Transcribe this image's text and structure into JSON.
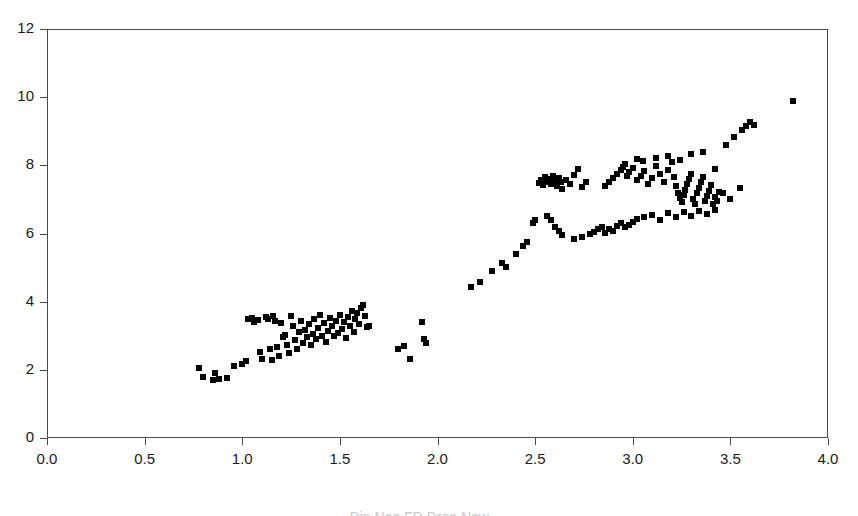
{
  "chart_data": {
    "type": "scatter",
    "title": "",
    "subtitle": "",
    "xlabel": "",
    "ylabel": "",
    "xlim": [
      0.0,
      4.0
    ],
    "ylim": [
      0,
      12
    ],
    "grid": false,
    "legend": null,
    "marker": {
      "shape": "square",
      "color": "#000000",
      "size_px": 6
    },
    "frame": {
      "border_color": "#4a4a4a",
      "background": "#ffffff"
    },
    "xticks": [
      0.0,
      0.5,
      1.0,
      1.5,
      2.0,
      2.5,
      3.0,
      3.5,
      4.0
    ],
    "xtick_labels": [
      "0.0",
      "0.5",
      "1.0",
      "1.5",
      "2.0",
      "2.5",
      "3.0",
      "3.5",
      "4.0"
    ],
    "yticks": [
      0,
      2,
      4,
      6,
      8,
      10,
      12
    ],
    "ytick_labels": [
      "0",
      "2",
      "4",
      "6",
      "8",
      "10",
      "12"
    ],
    "series": [
      {
        "name": "observations",
        "points": [
          [
            0.78,
            2.05
          ],
          [
            0.8,
            1.78
          ],
          [
            0.85,
            1.7
          ],
          [
            0.86,
            1.9
          ],
          [
            0.88,
            1.72
          ],
          [
            0.92,
            1.76
          ],
          [
            0.96,
            2.1
          ],
          [
            1.0,
            2.18
          ],
          [
            1.02,
            2.25
          ],
          [
            1.03,
            3.48
          ],
          [
            1.05,
            3.52
          ],
          [
            1.06,
            3.4
          ],
          [
            1.08,
            3.46
          ],
          [
            1.09,
            2.52
          ],
          [
            1.1,
            2.32
          ],
          [
            1.12,
            3.55
          ],
          [
            1.13,
            3.5
          ],
          [
            1.14,
            2.6
          ],
          [
            1.15,
            2.28
          ],
          [
            1.16,
            3.58
          ],
          [
            1.17,
            3.44
          ],
          [
            1.18,
            2.68
          ],
          [
            1.19,
            2.4
          ],
          [
            1.2,
            3.38
          ],
          [
            1.21,
            2.95
          ],
          [
            1.22,
            3.02
          ],
          [
            1.23,
            2.72
          ],
          [
            1.24,
            2.5
          ],
          [
            1.25,
            3.58
          ],
          [
            1.26,
            3.3
          ],
          [
            1.27,
            2.88
          ],
          [
            1.28,
            2.62
          ],
          [
            1.29,
            3.1
          ],
          [
            1.3,
            3.42
          ],
          [
            1.31,
            2.8
          ],
          [
            1.32,
            3.18
          ],
          [
            1.33,
            2.96
          ],
          [
            1.34,
            3.34
          ],
          [
            1.35,
            2.74
          ],
          [
            1.36,
            3.05
          ],
          [
            1.37,
            3.48
          ],
          [
            1.38,
            2.9
          ],
          [
            1.39,
            3.22
          ],
          [
            1.4,
            3.6
          ],
          [
            1.41,
            3.0
          ],
          [
            1.42,
            3.36
          ],
          [
            1.43,
            2.82
          ],
          [
            1.44,
            3.14
          ],
          [
            1.45,
            3.52
          ],
          [
            1.46,
            3.28
          ],
          [
            1.47,
            2.98
          ],
          [
            1.48,
            3.44
          ],
          [
            1.49,
            3.08
          ],
          [
            1.5,
            3.62
          ],
          [
            1.51,
            3.2
          ],
          [
            1.52,
            3.4
          ],
          [
            1.53,
            2.92
          ],
          [
            1.54,
            3.56
          ],
          [
            1.55,
            3.3
          ],
          [
            1.56,
            3.74
          ],
          [
            1.57,
            3.12
          ],
          [
            1.58,
            3.5
          ],
          [
            1.59,
            3.66
          ],
          [
            1.6,
            3.34
          ],
          [
            1.61,
            3.82
          ],
          [
            1.62,
            3.9
          ],
          [
            1.63,
            3.58
          ],
          [
            1.64,
            3.26
          ],
          [
            1.65,
            3.3
          ],
          [
            1.8,
            2.62
          ],
          [
            1.83,
            2.7
          ],
          [
            1.86,
            2.32
          ],
          [
            1.92,
            3.4
          ],
          [
            1.93,
            2.9
          ],
          [
            1.94,
            2.78
          ],
          [
            2.17,
            4.42
          ],
          [
            2.22,
            4.58
          ],
          [
            2.28,
            4.9
          ],
          [
            2.33,
            5.12
          ],
          [
            2.35,
            5.02
          ],
          [
            2.4,
            5.4
          ],
          [
            2.44,
            5.62
          ],
          [
            2.46,
            5.74
          ],
          [
            2.49,
            6.32
          ],
          [
            2.5,
            6.4
          ],
          [
            2.52,
            7.48
          ],
          [
            2.53,
            7.58
          ],
          [
            2.54,
            7.42
          ],
          [
            2.55,
            7.66
          ],
          [
            2.56,
            7.52
          ],
          [
            2.57,
            7.6
          ],
          [
            2.58,
            7.46
          ],
          [
            2.59,
            7.7
          ],
          [
            2.6,
            7.54
          ],
          [
            2.61,
            7.38
          ],
          [
            2.62,
            7.62
          ],
          [
            2.63,
            7.5
          ],
          [
            2.64,
            7.3
          ],
          [
            2.66,
            7.56
          ],
          [
            2.68,
            7.44
          ],
          [
            2.7,
            7.72
          ],
          [
            2.72,
            7.9
          ],
          [
            2.74,
            7.36
          ],
          [
            2.76,
            7.52
          ],
          [
            2.56,
            6.52
          ],
          [
            2.58,
            6.4
          ],
          [
            2.6,
            6.2
          ],
          [
            2.62,
            6.08
          ],
          [
            2.64,
            5.95
          ],
          [
            2.7,
            5.85
          ],
          [
            2.74,
            5.9
          ],
          [
            2.78,
            5.98
          ],
          [
            2.8,
            6.05
          ],
          [
            2.82,
            6.12
          ],
          [
            2.84,
            6.2
          ],
          [
            2.86,
            6.02
          ],
          [
            2.88,
            6.14
          ],
          [
            2.9,
            6.08
          ],
          [
            2.92,
            6.22
          ],
          [
            2.94,
            6.3
          ],
          [
            2.96,
            6.18
          ],
          [
            2.98,
            6.26
          ],
          [
            3.0,
            6.34
          ],
          [
            2.86,
            7.38
          ],
          [
            2.88,
            7.52
          ],
          [
            2.9,
            7.62
          ],
          [
            2.92,
            7.74
          ],
          [
            2.94,
            7.86
          ],
          [
            2.95,
            7.96
          ],
          [
            2.96,
            8.04
          ],
          [
            2.97,
            7.68
          ],
          [
            2.98,
            7.8
          ],
          [
            3.0,
            7.92
          ],
          [
            3.02,
            7.58
          ],
          [
            3.04,
            7.7
          ],
          [
            3.06,
            7.84
          ],
          [
            3.08,
            7.46
          ],
          [
            3.1,
            7.62
          ],
          [
            3.12,
            7.98
          ],
          [
            3.14,
            7.74
          ],
          [
            3.16,
            7.52
          ],
          [
            3.18,
            7.86
          ],
          [
            3.2,
            8.1
          ],
          [
            3.21,
            7.66
          ],
          [
            3.22,
            7.4
          ],
          [
            3.23,
            7.2
          ],
          [
            3.24,
            7.04
          ],
          [
            3.25,
            6.92
          ],
          [
            3.26,
            7.12
          ],
          [
            3.27,
            7.28
          ],
          [
            3.28,
            7.44
          ],
          [
            3.29,
            7.6
          ],
          [
            3.3,
            7.76
          ],
          [
            3.31,
            7.02
          ],
          [
            3.32,
            6.86
          ],
          [
            3.33,
            7.18
          ],
          [
            3.34,
            7.34
          ],
          [
            3.35,
            7.5
          ],
          [
            3.36,
            7.66
          ],
          [
            3.37,
            6.96
          ],
          [
            3.38,
            7.1
          ],
          [
            3.39,
            7.26
          ],
          [
            3.4,
            7.42
          ],
          [
            3.41,
            6.88
          ],
          [
            3.42,
            7.06
          ],
          [
            3.43,
            6.94
          ],
          [
            3.44,
            7.22
          ],
          [
            3.02,
            6.42
          ],
          [
            3.06,
            6.48
          ],
          [
            3.1,
            6.55
          ],
          [
            3.14,
            6.4
          ],
          [
            3.18,
            6.6
          ],
          [
            3.22,
            6.48
          ],
          [
            3.26,
            6.62
          ],
          [
            3.3,
            6.52
          ],
          [
            3.34,
            6.66
          ],
          [
            3.38,
            6.58
          ],
          [
            3.42,
            6.7
          ],
          [
            3.46,
            7.18
          ],
          [
            3.02,
            8.18
          ],
          [
            3.05,
            8.12
          ],
          [
            3.12,
            8.22
          ],
          [
            3.18,
            8.28
          ],
          [
            3.24,
            8.16
          ],
          [
            3.3,
            8.32
          ],
          [
            3.36,
            8.4
          ],
          [
            3.42,
            7.9
          ],
          [
            3.48,
            8.6
          ],
          [
            3.52,
            8.82
          ],
          [
            3.56,
            9.04
          ],
          [
            3.58,
            9.16
          ],
          [
            3.6,
            9.26
          ],
          [
            3.62,
            9.18
          ],
          [
            3.55,
            7.34
          ],
          [
            3.5,
            7.02
          ],
          [
            3.82,
            9.9
          ]
        ]
      }
    ]
  },
  "caption": {
    "text": "Din Noo  FD Droo New ...."
  }
}
